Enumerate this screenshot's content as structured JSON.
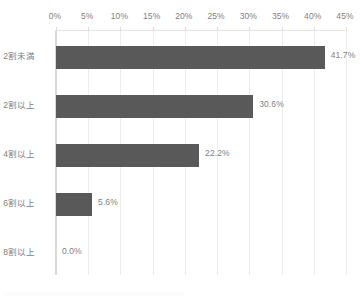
{
  "chart_data": {
    "type": "bar",
    "orientation": "horizontal",
    "title": "",
    "xlabel": "",
    "ylabel": "",
    "categories": [
      "2割未満",
      "2割以上",
      "4割以上",
      "6割以上",
      "8割以上"
    ],
    "values": [
      41.7,
      30.6,
      22.2,
      5.6,
      0.0
    ],
    "value_labels": [
      "41.7%",
      "30.6%",
      "22.2%",
      "5.6%",
      "0.0%"
    ],
    "xlim": [
      0,
      45
    ],
    "xticks": [
      0,
      5,
      10,
      15,
      20,
      25,
      30,
      35,
      40,
      45
    ],
    "xtick_labels": [
      "0%",
      "5%",
      "10%",
      "15%",
      "20%",
      "25%",
      "30%",
      "35%",
      "40%",
      "45%"
    ],
    "grid": true,
    "grid_axis": "x",
    "legend": false,
    "series": [
      {
        "name": "",
        "values": [
          41.7,
          30.6,
          22.2,
          5.6,
          0.0
        ]
      }
    ],
    "colors": {
      "bar": "#595959",
      "gridline": "#ededed",
      "axis_line": "#d9d9d9",
      "tick_text": "#808080",
      "background": "#ffffff"
    }
  }
}
